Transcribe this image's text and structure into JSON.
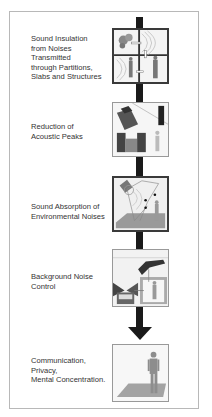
{
  "diagram": {
    "colors": {
      "spine": "#1a1a1a",
      "frame": "#b8b8b8",
      "text": "#333333",
      "panel_border": "#3a3a3a"
    },
    "steps": [
      {
        "label": "Sound Insulation\nfrom Noises\nTransmitted\nthrough Partitions,\nSlabs and Structures",
        "illustration": "rooms-with-sound-transmission-icon"
      },
      {
        "label": "Reduction of\nAcoustic Peaks",
        "illustration": "telephone-and-stereo-speakers-icon"
      },
      {
        "label": "Sound Absorption of\nEnvironmental Noises",
        "illustration": "room-reflections-with-listener-icon"
      },
      {
        "label": "Background Noise\nControl",
        "illustration": "airplane-and-vehicle-noise-icon"
      },
      {
        "label": "Communication,\nPrivacy,\nMental Concentration.",
        "illustration": "person-standing-on-floor-icon"
      }
    ],
    "arrow": "down-arrow-icon"
  }
}
